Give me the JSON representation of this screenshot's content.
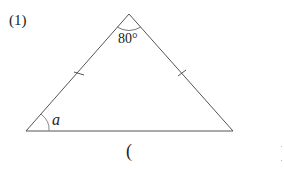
{
  "problem": {
    "number": "(1)",
    "apex_angle": "80°",
    "base_angle_var": "a",
    "answer_open": "("
  },
  "figure": {
    "shape": "isosceles triangle",
    "equal_sides_marked": true,
    "line_color": "#555555"
  }
}
